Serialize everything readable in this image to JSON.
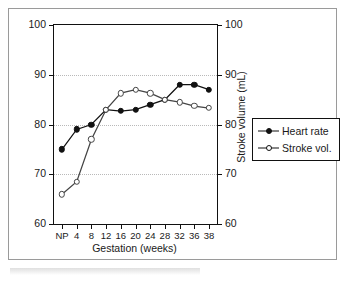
{
  "chart_data": {
    "type": "line",
    "title": "",
    "xlabel": "Gestation (weeks)",
    "ylabel": "Heart rate (beats/min)",
    "y2label": "Stroke volume (mL)",
    "categories": [
      "NP",
      "4",
      "8",
      "12",
      "16",
      "20",
      "24",
      "28",
      "32",
      "36",
      "38"
    ],
    "ylim": [
      60,
      100
    ],
    "y2lim": [
      60,
      100
    ],
    "yticks": [
      "100",
      "90",
      "80",
      "70",
      "60"
    ],
    "y2ticks": [
      "100",
      "90",
      "80",
      "70",
      "60"
    ],
    "grid": true,
    "legend_position": "right",
    "series": [
      {
        "name": "Heart rate",
        "axis": "left",
        "marker": "filled-circle",
        "values": [
          75,
          79,
          80,
          83,
          82.7,
          83,
          84,
          85,
          88,
          88,
          87
        ]
      },
      {
        "name": "Stroke vol.",
        "axis": "right",
        "marker": "open-circle",
        "values": [
          66,
          68.5,
          77,
          83,
          86.3,
          87,
          86.3,
          85,
          84.5,
          83.7,
          83.3
        ]
      }
    ]
  },
  "legend": {
    "items": [
      {
        "label": "Heart rate"
      },
      {
        "label": "Stroke vol."
      }
    ]
  },
  "colors": {
    "axis": "#111111",
    "grid": "#b9b9b9",
    "heart_rate": "#111111",
    "stroke_volume": "#444444",
    "border": "#9a9a9a"
  }
}
